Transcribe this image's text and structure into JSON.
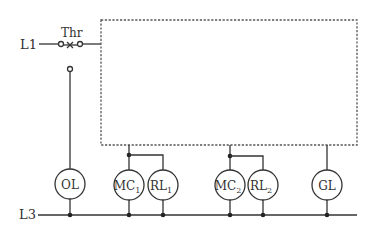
{
  "diagram": {
    "lines": {
      "top": "L1",
      "bottom": "L3"
    },
    "switch": {
      "label": "Thr",
      "type": "thermal-overload-contact"
    },
    "components": [
      {
        "id": "OL",
        "label": "OL",
        "sub": ""
      },
      {
        "id": "MC1",
        "label": "MC",
        "sub": "1"
      },
      {
        "id": "RL1",
        "label": "RL",
        "sub": "1"
      },
      {
        "id": "MC2",
        "label": "MC",
        "sub": "2"
      },
      {
        "id": "RL2",
        "label": "RL",
        "sub": "2"
      },
      {
        "id": "GL",
        "label": "GL",
        "sub": ""
      }
    ],
    "control_block": {
      "style": "dashed",
      "content": ""
    }
  },
  "colors": {
    "line": "#333333",
    "dashed": "#555555",
    "background": "#ffffff"
  }
}
